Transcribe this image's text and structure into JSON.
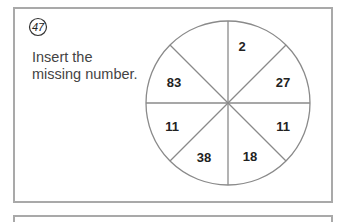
{
  "puzzle": {
    "number": "47",
    "prompt_line1": "Insert the",
    "prompt_line2": "missing number.",
    "wheel": {
      "segments": [
        {
          "position": "top-left",
          "value": ""
        },
        {
          "position": "top-right",
          "value": "2"
        },
        {
          "position": "right-upper",
          "value": "27"
        },
        {
          "position": "right-lower",
          "value": "11"
        },
        {
          "position": "bottom-right",
          "value": "18"
        },
        {
          "position": "bottom-left",
          "value": "38"
        },
        {
          "position": "left-lower",
          "value": "11"
        },
        {
          "position": "left-upper",
          "value": "83"
        }
      ]
    }
  }
}
